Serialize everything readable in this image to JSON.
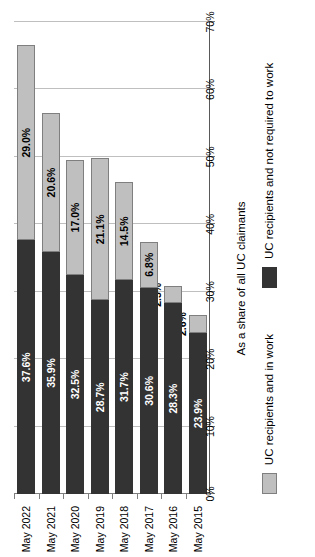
{
  "chart_data": {
    "type": "bar",
    "subtype": "stacked-horizontal-bar",
    "title": "",
    "xlabel": "",
    "ylabel": "As a share of all UC claimants",
    "ylim": [
      0,
      70
    ],
    "ytick_labels": [
      "0%",
      "10%",
      "20%",
      "30%",
      "40%",
      "50%",
      "60%",
      "70%"
    ],
    "ytick_values": [
      0,
      10,
      20,
      30,
      40,
      50,
      60,
      70
    ],
    "grid": true,
    "legend_position": "bottom",
    "categories": [
      "May 2015",
      "May 2016",
      "May 2017",
      "May 2018",
      "May 2019",
      "May 2020",
      "May 2021",
      "May 2022"
    ],
    "series": [
      {
        "name": "UC recipients and not required to work",
        "color": "#333333",
        "values": [
          23.9,
          28.3,
          30.6,
          31.7,
          28.7,
          32.5,
          35.9,
          37.6
        ],
        "labels": [
          "23.9%",
          "28.3%",
          "30.6%",
          "31.7%",
          "28.7%",
          "32.5%",
          "35.9%",
          "37.6%"
        ]
      },
      {
        "name": "UC recipients and in work",
        "color": "#bfbfbf",
        "values": [
          2.6,
          2.5,
          6.8,
          14.5,
          21.1,
          17.0,
          20.6,
          29.0
        ],
        "labels": [
          "2.6%",
          "2.5%",
          "6.8%",
          "14.5%",
          "21.1%",
          "17.0%",
          "20.6%",
          "29.0%"
        ]
      }
    ]
  },
  "legend": {
    "items": [
      {
        "label": "UC recipients and in work",
        "color": "#bfbfbf"
      },
      {
        "label": "UC recipients and not required to work",
        "color": "#333333"
      }
    ]
  },
  "axis": {
    "value_axis_title": "As a share of all UC claimants"
  }
}
